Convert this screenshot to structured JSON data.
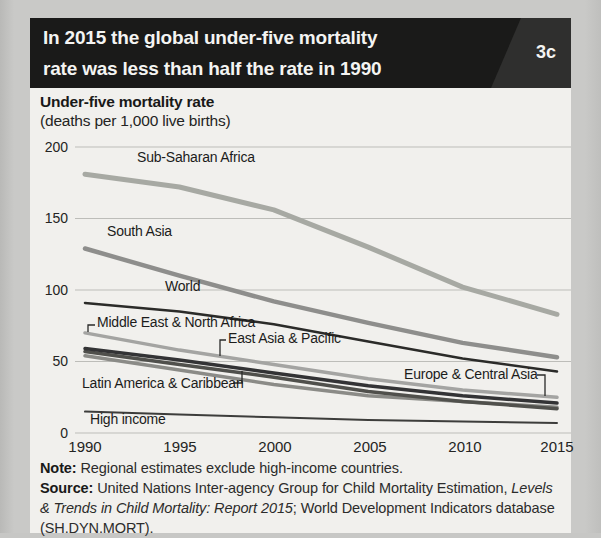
{
  "header": {
    "title_line1": "In 2015 the global under-five mortality",
    "title_line2": "rate was less than half the rate in 1990",
    "figure_tag": "3c",
    "bar_color": "#1a1a19",
    "corner_color": "#2f2f2e"
  },
  "chart_header": {
    "title": "Under-five mortality rate",
    "subtitle": "(deaths per 1,000 live births)"
  },
  "chart_data": {
    "type": "line",
    "title": "Under-five mortality rate (deaths per 1,000 live births)",
    "x": [
      1990,
      1995,
      2000,
      2005,
      2010,
      2015
    ],
    "xticks": [
      "1990",
      "1995",
      "2000",
      "2005",
      "2010",
      "2015"
    ],
    "yticks": [
      200,
      150,
      100,
      50,
      0
    ],
    "ylim": [
      0,
      200
    ],
    "grid": "horizontal",
    "legend_position": "inline-labels",
    "series": [
      {
        "name": "Sub-Saharan Africa",
        "color": "#a7a9a3",
        "width": 5,
        "values": [
          181,
          172,
          156,
          130,
          102,
          83
        ]
      },
      {
        "name": "South Asia",
        "color": "#8e8e8c",
        "width": 4.5,
        "values": [
          129,
          110,
          92,
          77,
          63,
          53
        ]
      },
      {
        "name": "World",
        "color": "#2b2b29",
        "width": 2.5,
        "values": [
          91,
          85,
          76,
          64,
          52,
          43
        ]
      },
      {
        "name": "Middle East & North Africa",
        "color": "#a4a4a2",
        "width": 3.5,
        "values": [
          70,
          58,
          48,
          38,
          30,
          25
        ]
      },
      {
        "name": "Latin America & Caribbean",
        "color": "#8b8b87",
        "width": 3.5,
        "values": [
          54,
          44,
          34,
          26,
          22,
          18
        ]
      },
      {
        "name": "East Asia & Pacific",
        "color": "#50504c",
        "width": 3.5,
        "values": [
          57,
          48,
          39,
          29,
          22,
          17
        ]
      },
      {
        "name": "Europe & Central Asia",
        "color": "#333335",
        "width": 3.5,
        "values": [
          59,
          51,
          42,
          33,
          26,
          21
        ]
      },
      {
        "name": "High income",
        "color": "#3d3d3b",
        "width": 2,
        "values": [
          15,
          13,
          11,
          9,
          8,
          7
        ]
      }
    ],
    "grid_color": "#bdbdb9"
  },
  "footer": {
    "note_label": "Note:",
    "note_text": " Regional estimates exclude high-income countries.",
    "source_label": "Source:",
    "source_text_1": " United Nations Inter-agency Group for Child Mortality Estimation, ",
    "source_italic": "Levels & Trends in Child Mortality: Report 2015",
    "source_text_2": "; World Development Indicators database (SH.DYN.MORT)."
  }
}
